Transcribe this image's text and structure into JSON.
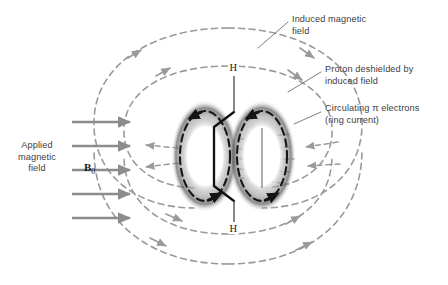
{
  "figure": {
    "background_color": "#ffffff",
    "width": 448,
    "height": 285
  },
  "colors": {
    "field_line": "#9a9a9a",
    "applied_arrow": "#8c8c8c",
    "ring_current": "#1a1a1a",
    "pi_cloud": "#2b2b2b",
    "bond": "#111111",
    "text": "#3d3d3d",
    "leader": "#6f6f6f"
  },
  "annotations": {
    "induced_field": {
      "label": "Induced magnetic\nfield",
      "x": 292,
      "y": 17
    },
    "proton_deshielded": {
      "label": "Proton deshielded by\ninduced field",
      "x": 325,
      "y": 66
    },
    "ring_current": {
      "label": "Circulating π electrons\n(ring current)",
      "x": 325,
      "y": 105
    },
    "applied_field": {
      "label": "Applied\nmagnetic\nfield",
      "x": 6,
      "y": 139
    },
    "b0": {
      "symbol": "B",
      "subscript": "0",
      "x": 84,
      "y": 163
    }
  },
  "molecule": {
    "hydrogen_top": {
      "label": "H",
      "x": 228,
      "y": 68
    },
    "hydrogen_bottom": {
      "label": "H",
      "x": 228,
      "y": 229
    }
  },
  "applied_field_arrows": {
    "count": 5,
    "direction": "right",
    "x_start": 72,
    "x_end": 136,
    "y_positions": [
      122,
      146,
      170,
      194,
      218
    ]
  },
  "induced_field_loops": {
    "count": 4,
    "description": "nested dashed loops with arrowheads encircling the ring"
  },
  "pi_clouds": {
    "count": 2,
    "description": "two shaded elliptical pi-electron clouds with dashed circulation arrows"
  }
}
